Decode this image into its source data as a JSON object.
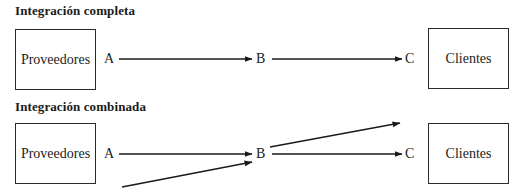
{
  "diagrams": [
    {
      "title": "Integración completa",
      "source_box": "Proveedores",
      "target_box": "Clientes",
      "nodes": [
        "A",
        "B",
        "C"
      ]
    },
    {
      "title": "Integración combinada",
      "source_box": "Proveedores",
      "target_box": "Clientes",
      "nodes": [
        "A",
        "B",
        "C"
      ]
    }
  ],
  "colors": {
    "line": "#1a1a1a",
    "text": "#222222",
    "background": "#ffffff"
  }
}
